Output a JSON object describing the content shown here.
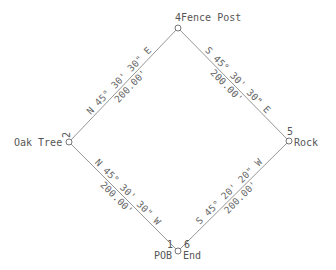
{
  "diagram": {
    "type": "survey-plat",
    "colors": {
      "line": "#8a8a8a",
      "text": "#555555",
      "background": "#ffffff"
    },
    "points": [
      {
        "id": "1",
        "label": "POB",
        "x": 178,
        "y": 251
      },
      {
        "id": "2",
        "label": "Oak Tree",
        "x": 69,
        "y": 142
      },
      {
        "id": "4",
        "label": "Fence Post",
        "x": 178,
        "y": 28
      },
      {
        "id": "5",
        "label": "Rock",
        "x": 289,
        "y": 141
      },
      {
        "id": "6",
        "label": "End",
        "x": 178,
        "y": 251
      }
    ],
    "courses": [
      {
        "from": "1",
        "to": "2",
        "bearing": "N 45° 30' 30\" W",
        "distance": "200.00'"
      },
      {
        "from": "2",
        "to": "4",
        "bearing": "N 45° 30' 30\" E",
        "distance": "200.00'"
      },
      {
        "from": "4",
        "to": "5",
        "bearing": "S 45° 30' 30\" E",
        "distance": "200.00'"
      },
      {
        "from": "5",
        "to": "6",
        "bearing": "S 45° 20' 20\" W",
        "distance": "200.00'"
      }
    ]
  },
  "labels": {
    "p4": "4Fence Post",
    "p2_num": "2",
    "p2_name": "Oak Tree",
    "p5_num": "5",
    "p5_name": "Rock",
    "p1_num": "1",
    "p1_name": "POB",
    "p6_num": "6",
    "p6_name": "End",
    "c24_bearing": "N 45° 30' 30\" E",
    "c24_dist": "200.00'",
    "c45_bearing": "S 45° 30' 30\" E",
    "c45_dist": "200.00'",
    "c12_bearing": "N 45° 30' 30\" W",
    "c12_dist": "200.00'",
    "c56_bearing": "S 45° 20' 20\" W",
    "c56_dist": "200.00'"
  }
}
